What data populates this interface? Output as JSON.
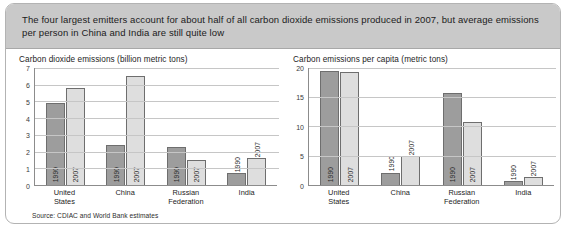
{
  "banner": {
    "text": "The four largest emitters account for about half of all carbon dioxide emissions produced in 2007, but average emissions per person in China and India are still quite low"
  },
  "source": {
    "text": "Source: CDIAC and World Bank estimates"
  },
  "colors": {
    "banner_bg": "#c9c9c9",
    "bar_1990": "#9d9d9d",
    "bar_2007": "#dedede",
    "bar_border": "#6e6e6e",
    "gridline": "#c6c6c6",
    "axis": "#8c8c8c",
    "card_border": "#b3b3b3"
  },
  "chart_data": [
    {
      "type": "bar",
      "title": "Carbon dioxide emissions (billion metric tons)",
      "xlabel": "",
      "ylabel": "",
      "ylim": [
        0,
        7
      ],
      "yticks": [
        0,
        1,
        2,
        3,
        4,
        5,
        6,
        7
      ],
      "ytick_labels": [
        "0",
        "1",
        "2",
        "3",
        "4",
        "5",
        "6",
        "7"
      ],
      "grid": true,
      "legend": "none",
      "categories": [
        "United States",
        "China",
        "Russian Federation",
        "India"
      ],
      "category_lines": [
        [
          "United",
          "States"
        ],
        [
          "China"
        ],
        [
          "Russian",
          "Federation"
        ],
        [
          "India"
        ]
      ],
      "series": [
        {
          "name": "1990",
          "values": [
            4.9,
            2.4,
            2.3,
            0.7
          ]
        },
        {
          "name": "2007",
          "values": [
            5.8,
            6.5,
            1.5,
            1.6
          ]
        }
      ],
      "bar_label_placement": [
        [
          "inside",
          "inside"
        ],
        [
          "inside",
          "inside"
        ],
        [
          "inside",
          "inside"
        ],
        [
          "above",
          "above"
        ]
      ]
    },
    {
      "type": "bar",
      "title": "Carbon emissions per capita (metric tons)",
      "xlabel": "",
      "ylabel": "",
      "ylim": [
        0,
        20
      ],
      "yticks": [
        0,
        5,
        10,
        15,
        20
      ],
      "ytick_labels": [
        "0",
        "5",
        "10",
        "15",
        "20"
      ],
      "grid": true,
      "legend": "none",
      "categories": [
        "United States",
        "China",
        "Russian Federation",
        "India"
      ],
      "category_lines": [
        [
          "United",
          "States"
        ],
        [
          "China"
        ],
        [
          "Russian",
          "Federation"
        ],
        [
          "India"
        ]
      ],
      "series": [
        {
          "name": "1990",
          "values": [
            19.5,
            2.1,
            15.7,
            0.7
          ]
        },
        {
          "name": "2007",
          "values": [
            19.3,
            5.0,
            10.7,
            1.3
          ]
        }
      ],
      "bar_label_placement": [
        [
          "inside",
          "inside"
        ],
        [
          "above",
          "above"
        ],
        [
          "inside",
          "inside"
        ],
        [
          "above",
          "above"
        ]
      ]
    }
  ]
}
